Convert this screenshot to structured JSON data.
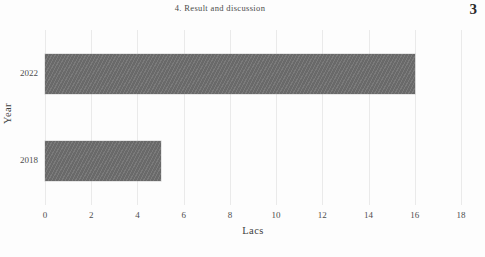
{
  "header": {
    "section_title": "4. Result and discussion",
    "page_number": "3"
  },
  "chart_data": {
    "type": "bar",
    "orientation": "horizontal",
    "title": "",
    "xlabel": "Lacs",
    "ylabel": "Year",
    "categories": [
      "2018",
      "2022"
    ],
    "values": [
      5,
      16
    ],
    "xlim": [
      0,
      18
    ],
    "xticks": [
      "0",
      "2",
      "4",
      "6",
      "8",
      "10",
      "12",
      "14",
      "16",
      "18"
    ],
    "xtick_values": [
      0,
      2,
      4,
      6,
      8,
      10,
      12,
      14,
      16,
      18
    ],
    "grid": "vertical",
    "legend": "none",
    "bar_color": "#6f6f6f",
    "gridline_color": "#eaeaea",
    "background_color": "#fdfdfd"
  }
}
